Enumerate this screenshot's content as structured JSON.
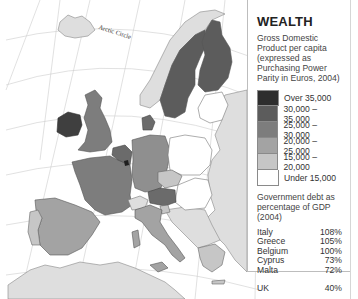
{
  "legend": {
    "title": "WEALTH",
    "subtitle": "Gross Domestic Product per capita (expressed as Purchasing Power Parity in Euros, 2004)",
    "classes": [
      {
        "label": "Over 35,000",
        "color": "#2e2e2e"
      },
      {
        "label": "30,000 – 35,000",
        "color": "#5c5c5c"
      },
      {
        "label": "25,000 – 30,000",
        "color": "#7d7d7d"
      },
      {
        "label": "20,000 – 25,000",
        "color": "#a3a3a3"
      },
      {
        "label": "15,000 – 20,000",
        "color": "#c6c6c6"
      },
      {
        "label": "Under 15,000",
        "color": "#ffffff"
      }
    ],
    "debt_title": "Government debt as percentage of GDP (2004)",
    "debt": [
      {
        "country": "Italy",
        "value": "108%"
      },
      {
        "country": "Greece",
        "value": "105%"
      },
      {
        "country": "Belgium",
        "value": "100%"
      },
      {
        "country": "Cyprus",
        "value": "73%"
      },
      {
        "country": "Malta",
        "value": "72%"
      }
    ],
    "debt_extra": {
      "country": "UK",
      "value": "40%"
    }
  },
  "map": {
    "arctic_label": "Arctic Circle",
    "non_eu_color": "#dedede",
    "sea_color": "#ffffff",
    "graticule_color": "#c8c8c8",
    "regions": [
      {
        "name": "Iceland",
        "class": "non-eu",
        "color": "#dedede"
      },
      {
        "name": "Norway",
        "class": "non-eu",
        "color": "#dedede"
      },
      {
        "name": "Sweden",
        "class": "25,000 – 30,000",
        "color": "#5c5c5c"
      },
      {
        "name": "Finland",
        "class": "25,000 – 30,000",
        "color": "#5c5c5c"
      },
      {
        "name": "Ireland",
        "class": "30,000 – 35,000",
        "color": "#3f3f3f"
      },
      {
        "name": "United Kingdom",
        "class": "25,000 – 30,000",
        "color": "#7d7d7d"
      },
      {
        "name": "Denmark",
        "class": "25,000 – 30,000",
        "color": "#6b6b6b"
      },
      {
        "name": "Netherlands",
        "class": "25,000 – 30,000",
        "color": "#6b6b6b"
      },
      {
        "name": "Belgium",
        "class": "25,000 – 30,000",
        "color": "#6b6b6b"
      },
      {
        "name": "Luxembourg",
        "class": "Over 35,000",
        "color": "#1e1e1e"
      },
      {
        "name": "France",
        "class": "25,000 – 30,000",
        "color": "#7d7d7d"
      },
      {
        "name": "Germany",
        "class": "25,000 – 30,000",
        "color": "#8f8f8f"
      },
      {
        "name": "Austria",
        "class": "25,000 – 30,000",
        "color": "#6b6b6b"
      },
      {
        "name": "Italy",
        "class": "20,000 – 25,000",
        "color": "#a3a3a3"
      },
      {
        "name": "Spain",
        "class": "20,000 – 25,000",
        "color": "#a3a3a3"
      },
      {
        "name": "Portugal",
        "class": "15,000 – 20,000",
        "color": "#c6c6c6"
      },
      {
        "name": "Greece",
        "class": "15,000 – 20,000",
        "color": "#c6c6c6"
      },
      {
        "name": "Czech Republic",
        "class": "15,000 – 20,000",
        "color": "#c6c6c6"
      },
      {
        "name": "Slovenia",
        "class": "15,000 – 20,000",
        "color": "#c6c6c6"
      },
      {
        "name": "Switzerland",
        "class": "non-eu",
        "color": "#dedede"
      },
      {
        "name": "Poland",
        "class": "Under 15,000",
        "color": "#ffffff"
      },
      {
        "name": "Slovakia",
        "class": "Under 15,000",
        "color": "#ffffff"
      },
      {
        "name": "Hungary",
        "class": "Under 15,000",
        "color": "#ffffff"
      },
      {
        "name": "Lithuania",
        "class": "Under 15,000",
        "color": "#ffffff"
      },
      {
        "name": "Latvia",
        "class": "Under 15,000",
        "color": "#ffffff"
      },
      {
        "name": "Estonia",
        "class": "Under 15,000",
        "color": "#ffffff"
      },
      {
        "name": "Eastern Europe (non-EU)",
        "class": "non-eu",
        "color": "#dedede"
      },
      {
        "name": "Balkans (non-EU)",
        "class": "non-eu",
        "color": "#dedede"
      },
      {
        "name": "North Africa (non-EU)",
        "class": "non-eu",
        "color": "#dedede"
      }
    ]
  }
}
